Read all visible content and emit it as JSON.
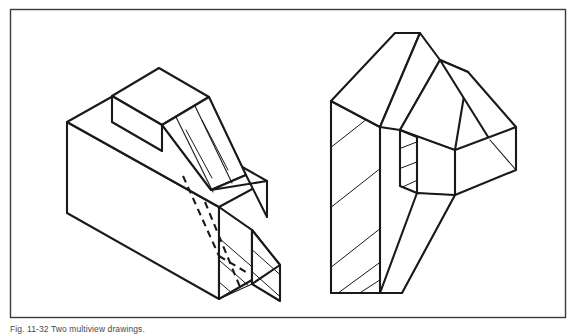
{
  "figure": {
    "caption": "Fig. 11-32  Two multiview drawings.",
    "frame": {
      "x": 10.5,
      "y": 9.5,
      "width": 555,
      "height": 308,
      "stroke": "#3a3a3a",
      "stroke_width": 1.4,
      "fill": "#ffffff"
    },
    "background_color": "#ffffff",
    "line_color": "#1a1a1a",
    "hatch_color": "#1a1a1a",
    "outline_width": 2.1,
    "inner_width": 1.1,
    "hatch_width": 1.0,
    "hidden_dash": "7,5",
    "objects": [
      {
        "name": "left-object",
        "description": "Isometric sectioned block with sloped rib and hatched cut faces",
        "outlines": [
          {
            "name": "base-block-front-face",
            "points": "67,122 67,213 219,299 219,207"
          },
          {
            "name": "base-block-top-face",
            "points": "67,122 115,95 267,181 219,207"
          },
          {
            "name": "rib-top-face",
            "points": "112,96 159,68 209,97 162,125"
          },
          {
            "name": "rib-left-face",
            "points": "112,96 112,122 162,151 162,125"
          },
          {
            "name": "slope-upper-face",
            "points": "162,125 209,97 246,175 211,190"
          },
          {
            "name": "slope-lower-wedge",
            "points": "211,190 246,175 267,217 267,181"
          },
          {
            "name": "cut-face-vertical",
            "points": "219,207 219,299 252,280 252,230"
          },
          {
            "name": "wedge-bottom-triangle",
            "points": "252,230 280,265 280,301 252,284"
          },
          {
            "name": "wedge-right-face",
            "points": "252,230 280,265 252,284"
          }
        ],
        "edges": [
          {
            "name": "rib-vertical-left-edge",
            "d": "M112,96 L112,122"
          },
          {
            "name": "rib-bottom-front-edge",
            "d": "M112,122 L162,151"
          },
          {
            "name": "rib-right-vertical-edge",
            "d": "M162,125 L162,151"
          },
          {
            "name": "slope-crease-a",
            "d": "M209,97 L246,175"
          },
          {
            "name": "slope-crease-b",
            "d": "M195,106 L232,183"
          },
          {
            "name": "slope-crease-c",
            "d": "M176,117 L213,192"
          },
          {
            "name": "slope-crease-d",
            "d": "M162,125 L211,190"
          },
          {
            "name": "cut-face-edge-top",
            "d": "M219,207 L252,230"
          },
          {
            "name": "cut-face-edge-bottom",
            "d": "M219,299 L252,284"
          },
          {
            "name": "wedge-outer-edge",
            "d": "M267,181 L267,217"
          },
          {
            "name": "wedge-right-lower",
            "d": "M252,284 L280,301"
          },
          {
            "name": "base-back-vertical",
            "d": "M267,181 L267,217"
          }
        ],
        "hidden_lines": [
          {
            "name": "hidden-rib-base-line",
            "d": "M183,176 L219,256"
          },
          {
            "name": "hidden-rib-vertical",
            "d": "M219,256 L246,272"
          },
          {
            "name": "hidden-slope-line",
            "d": "M205,202 L240,287"
          }
        ],
        "hatch_regions": [
          {
            "name": "hatch-cut-face-vertical",
            "clip": "219,207 252,230 252,284 219,299",
            "lines": [
              "M212,232 L258,272",
              "M212,254 L258,294",
              "M212,276 L240,300",
              "M224,204 L258,234"
            ]
          },
          {
            "name": "hatch-wedge-triangle",
            "clip": "252,230 280,265 280,301 252,284",
            "lines": [
              "M248,246 L286,280",
              "M248,268 L286,302",
              "M256,228 L286,256"
            ]
          },
          {
            "name": "hatch-slope-band",
            "clip": "162,125 209,97 246,175 211,190",
            "lines": [
              "M170,139 L196,186",
              "M186,130 L212,178",
              "M202,120 L228,170",
              "M218,112 L244,162"
            ]
          }
        ]
      },
      {
        "name": "right-object",
        "description": "Isometric sectioned L-shaped part with vertical hatched slab and offset block",
        "outlines": [
          {
            "name": "vertical-slab-front-face",
            "points": "331,101 331,293 380,293 380,127"
          },
          {
            "name": "vertical-slab-top-face",
            "points": "331,101 395,33 420,33 380,127"
          },
          {
            "name": "slab-right-upper-face",
            "points": "380,127 420,33 440,60 400,130"
          },
          {
            "name": "mid-block-top-face",
            "points": "400,130 440,60 468,72 455,150"
          },
          {
            "name": "right-block-top-face",
            "points": "440,60 468,72 516,127 490,140"
          },
          {
            "name": "right-block-front-face",
            "points": "455,150 516,127 516,170 455,195"
          },
          {
            "name": "cut-face-mid-vertical",
            "points": "400,130 417,137 417,193 400,186"
          },
          {
            "name": "lower-tail",
            "points": "380,293 402,293 455,195 417,193"
          }
        ],
        "edges": [
          {
            "name": "slab-top-back-edge",
            "d": "M395,33 L420,33"
          },
          {
            "name": "slab-front-vertical",
            "d": "M331,101 L331,293"
          },
          {
            "name": "slab-right-vertical",
            "d": "M380,127 L380,293"
          },
          {
            "name": "slab-bottom-edge",
            "d": "M331,293 L380,293"
          },
          {
            "name": "mid-block-edge-a",
            "d": "M440,60 L468,72"
          },
          {
            "name": "mid-block-edge-b",
            "d": "M400,130 L455,150"
          },
          {
            "name": "right-block-outer-edge",
            "d": "M516,127 L516,170"
          },
          {
            "name": "right-block-lower-edge",
            "d": "M455,150 L455,195"
          },
          {
            "name": "right-block-diag",
            "d": "M490,140 L516,170"
          },
          {
            "name": "tail-diag-upper",
            "d": "M417,193 L455,195"
          },
          {
            "name": "tail-diag-lower",
            "d": "M402,293 L455,195"
          },
          {
            "name": "tail-left-diag",
            "d": "M380,293 L402,293"
          },
          {
            "name": "cut-face-mid-top",
            "d": "M400,130 L417,137"
          },
          {
            "name": "cut-face-mid-bottom",
            "d": "M400,186 L417,193"
          },
          {
            "name": "mid-crease",
            "d": "M417,137 L417,193"
          }
        ],
        "hidden_lines": [],
        "hatch_regions": [
          {
            "name": "hatch-slab-front",
            "clip": "331,101 380,127 380,293 331,293",
            "lines": [
              "M325,152 L386,104",
              "M325,212 L386,164",
              "M325,272 L386,224",
              "M334,296 L386,258",
              "M352,298 L386,276"
            ]
          },
          {
            "name": "hatch-mid-cut-face",
            "clip": "400,130 417,137 417,193 400,186",
            "lines": [
              "M396,150 L422,140",
              "M396,170 L422,160",
              "M396,190 L422,178"
            ]
          }
        ]
      }
    ]
  }
}
